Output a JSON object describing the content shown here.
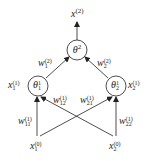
{
  "diagram": {
    "type": "neural-network",
    "output": {
      "base": "x",
      "sup": "(2)"
    },
    "nodes": {
      "top": {
        "base": "θ",
        "sup": "2",
        "sub": ""
      },
      "left": {
        "base": "θ",
        "sup": "1",
        "sub": "1",
        "side_label": {
          "base": "x",
          "sub": "1",
          "sup": "(1)"
        }
      },
      "right": {
        "base": "θ",
        "sup": "1",
        "sub": "2",
        "side_label": {
          "base": "x",
          "sub": "2",
          "sup": "(1)"
        }
      }
    },
    "inputs": [
      {
        "base": "x",
        "sub": "1",
        "sup": "(0)"
      },
      {
        "base": "x",
        "sub": "2",
        "sup": "(0)"
      }
    ],
    "weights": {
      "w1_2": {
        "base": "w",
        "sub": "1",
        "sup": "(2)"
      },
      "w2_2": {
        "base": "w",
        "sub": "2",
        "sup": "(2)"
      },
      "w11_1": {
        "base": "w",
        "sub": "11",
        "sup": "(1)"
      },
      "w12_1": {
        "base": "w",
        "sub": "12",
        "sup": "(1)"
      },
      "w21_1": {
        "base": "w",
        "sub": "21",
        "sup": "(1)"
      },
      "w22_1": {
        "base": "w",
        "sub": "22",
        "sup": "(1)"
      }
    },
    "colors": {
      "stroke": "#222222",
      "background": "#ffffff"
    }
  }
}
